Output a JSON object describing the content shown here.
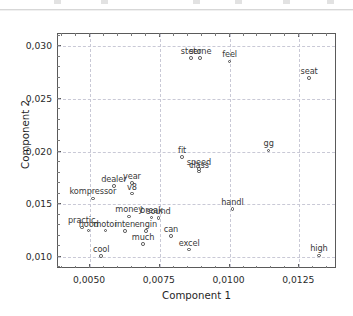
{
  "window": {
    "chrome_visible": true
  },
  "chart_data": {
    "type": "scatter",
    "title": "",
    "xlabel": "Component 1",
    "ylabel": "Component 2",
    "xlim": [
      0.00385,
      0.01385
    ],
    "ylim": [
      0.00885,
      0.03115
    ],
    "xticks": [
      0.005,
      0.0075,
      0.01,
      0.0125
    ],
    "xticklabels": [
      "0,0050",
      "0,0075",
      "0,0100",
      "0,0125"
    ],
    "yticks": [
      0.01,
      0.015,
      0.02,
      0.025,
      0.03
    ],
    "yticklabels": [
      "0,010",
      "0,015",
      "0,020",
      "0,025",
      "0,030"
    ],
    "grid": true,
    "grid_style": "dashed",
    "marker": "open-circle",
    "marker_color": "#4a4a4a",
    "label_color": "#3a3a3a",
    "legend": null,
    "points": [
      {
        "label": "steer",
        "x": 0.00862,
        "y": 0.0289
      },
      {
        "label": "stone",
        "x": 0.00895,
        "y": 0.02885
      },
      {
        "label": "feel",
        "x": 0.01,
        "y": 0.02855
      },
      {
        "label": "seat",
        "x": 0.01285,
        "y": 0.027
      },
      {
        "label": "gg",
        "x": 0.0114,
        "y": 0.0201
      },
      {
        "label": "fit",
        "x": 0.0083,
        "y": 0.01945
      },
      {
        "label": "speed",
        "x": 0.0089,
        "y": 0.01835
      },
      {
        "label": "class",
        "x": 0.0089,
        "y": 0.0181
      },
      {
        "label": "year",
        "x": 0.0065,
        "y": 0.017
      },
      {
        "label": "dealer",
        "x": 0.00585,
        "y": 0.01675
      },
      {
        "label": "v8",
        "x": 0.0065,
        "y": 0.016
      },
      {
        "label": "kompressor",
        "x": 0.0051,
        "y": 0.01555
      },
      {
        "label": "handl",
        "x": 0.0101,
        "y": 0.01455
      },
      {
        "label": "money",
        "x": 0.0064,
        "y": 0.01385
      },
      {
        "label": "break",
        "x": 0.0072,
        "y": 0.01375
      },
      {
        "label": "sound",
        "x": 0.00745,
        "y": 0.0137
      },
      {
        "label": "practic",
        "x": 0.0047,
        "y": 0.0128
      },
      {
        "label": "hood",
        "x": 0.00495,
        "y": 0.0125
      },
      {
        "label": "motor",
        "x": 0.00555,
        "y": 0.0125
      },
      {
        "label": "inten",
        "x": 0.00625,
        "y": 0.01245
      },
      {
        "label": "engin",
        "x": 0.007,
        "y": 0.01245
      },
      {
        "label": "can",
        "x": 0.0079,
        "y": 0.012
      },
      {
        "label": "much",
        "x": 0.0069,
        "y": 0.01125
      },
      {
        "label": "excel",
        "x": 0.00855,
        "y": 0.0107
      },
      {
        "label": "cool",
        "x": 0.0054,
        "y": 0.0101
      },
      {
        "label": "high",
        "x": 0.0132,
        "y": 0.01015
      }
    ]
  }
}
